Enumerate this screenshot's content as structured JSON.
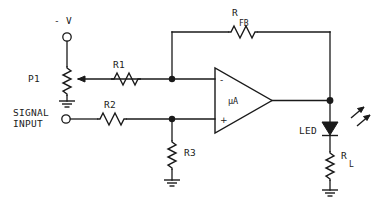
{
  "diagram": {
    "background_color": "#ffffff",
    "line_color": "#1a1a1a"
  },
  "labels": {
    "supply": "- V",
    "pot": "P1",
    "r1": "R1",
    "r2": "R2",
    "r3": "R3",
    "rfb_main": "R",
    "rfb_sub": "FB",
    "rl_main": "R",
    "rl_sub": "L",
    "opamp": "µA",
    "opamp_inverting": "-",
    "opamp_noninverting": "+",
    "led": "LED",
    "signal_line1": "SIGNAL",
    "signal_line2": "INPUT"
  },
  "components": [
    {
      "id": "P1",
      "type": "potentiometer",
      "label": "P1"
    },
    {
      "id": "R1",
      "type": "resistor",
      "label": "R1"
    },
    {
      "id": "R2",
      "type": "resistor",
      "label": "R2"
    },
    {
      "id": "R3",
      "type": "resistor",
      "label": "R3"
    },
    {
      "id": "RFB",
      "type": "resistor",
      "label": "R FB"
    },
    {
      "id": "RL",
      "type": "resistor",
      "label": "R L"
    },
    {
      "id": "U1",
      "type": "operational-amplifier",
      "label": "µA"
    },
    {
      "id": "D1",
      "type": "light-emitting-diode",
      "label": "LED"
    }
  ],
  "terminals": [
    {
      "id": "supply-terminal",
      "label": "- V"
    },
    {
      "id": "signal-input-terminal",
      "label": "SIGNAL INPUT"
    }
  ],
  "grounds": [
    {
      "id": "gnd-p1"
    },
    {
      "id": "gnd-r3"
    },
    {
      "id": "gnd-rl"
    }
  ]
}
